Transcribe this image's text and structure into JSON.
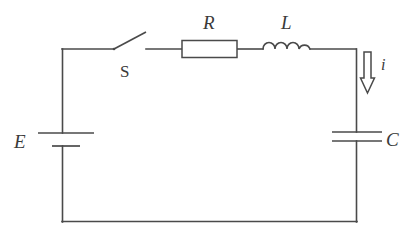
{
  "diagram": {
    "type": "electrical-schematic",
    "background_color": "#ffffff",
    "line_color": "#4a4a4a",
    "label_color": "#3a3a3a"
  },
  "labels": {
    "source": "E",
    "switch": "S",
    "resistor": "R",
    "inductor": "L",
    "capacitor": "C",
    "current": "i"
  },
  "components": [
    {
      "name": "voltage-source",
      "symbol": "battery",
      "label": "E",
      "position": "left-branch",
      "state": "closed-cell",
      "plates": 2
    },
    {
      "name": "switch",
      "symbol": "spst-switch",
      "label": "S",
      "position": "top-branch-left",
      "state": "open"
    },
    {
      "name": "resistor",
      "symbol": "rectangle-box",
      "label": "R",
      "position": "top-branch-middle"
    },
    {
      "name": "inductor",
      "symbol": "coil",
      "label": "L",
      "position": "top-branch-right",
      "turns": 4
    },
    {
      "name": "capacitor",
      "symbol": "parallel-plates",
      "label": "C",
      "position": "right-branch",
      "plates": 2
    },
    {
      "name": "current-arrow",
      "symbol": "hollow-down-arrow",
      "label": "i",
      "position": "right-branch-upper",
      "direction": "down"
    }
  ]
}
